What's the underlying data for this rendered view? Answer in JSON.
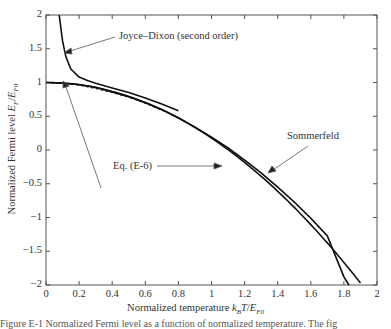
{
  "chart_data": {
    "type": "line",
    "title": "",
    "xlabel": "Normalized temperature k_B T/E_F0",
    "ylabel": "Normalized Fermi level E_F/E_F0",
    "xlim": [
      0,
      2
    ],
    "ylim": [
      -2,
      2
    ],
    "grid": false,
    "xticks": [
      "0",
      "0.2",
      "0.4",
      "0.6",
      "0.8",
      "1",
      "1.2",
      "1.4",
      "1.6",
      "1.8",
      "2"
    ],
    "yticks": [
      "2",
      "1.5",
      "1",
      "0.5",
      "0",
      "−0.5",
      "−1",
      "−1.5",
      "−2"
    ],
    "series": [
      {
        "name": "Joyce–Dixon (second order)",
        "style": "solid",
        "x": [
          0.08,
          0.1,
          0.12,
          0.15,
          0.2,
          0.25,
          0.3,
          0.4,
          0.5,
          0.6,
          0.7,
          0.8
        ],
        "y": [
          2.0,
          1.62,
          1.38,
          1.2,
          1.08,
          1.03,
          0.99,
          0.92,
          0.85,
          0.77,
          0.68,
          0.58
        ]
      },
      {
        "name": "Eq. (E-6)",
        "style": "solid",
        "x": [
          0,
          0.1,
          0.2,
          0.3,
          0.4,
          0.5,
          0.6,
          0.7,
          0.8,
          0.9,
          1.0,
          1.1,
          1.2,
          1.3,
          1.4,
          1.5,
          1.6,
          1.7,
          1.8,
          1.83
        ],
        "y": [
          1.0,
          0.99,
          0.97,
          0.93,
          0.86,
          0.79,
          0.7,
          0.6,
          0.48,
          0.34,
          0.19,
          0.03,
          -0.15,
          -0.34,
          -0.55,
          -0.77,
          -1.01,
          -1.27,
          -1.88,
          -2.0
        ]
      },
      {
        "name": "Dashed (exact)",
        "style": "dashed",
        "x": [
          0,
          0.1,
          0.2,
          0.3,
          0.4,
          0.5,
          0.6,
          0.7,
          0.8,
          0.9,
          1.0,
          1.1,
          1.2,
          1.3,
          1.4,
          1.5,
          1.6,
          1.7,
          1.8,
          1.83
        ],
        "y": [
          1.0,
          0.99,
          0.96,
          0.91,
          0.85,
          0.78,
          0.69,
          0.59,
          0.47,
          0.34,
          0.19,
          0.03,
          -0.15,
          -0.34,
          -0.55,
          -0.78,
          -1.02,
          -1.28,
          -1.88,
          -2.0
        ]
      },
      {
        "name": "Sommerfeld",
        "style": "solid",
        "formula": "1 - (pi^2/12) t^2",
        "x": [
          0,
          0.2,
          0.4,
          0.6,
          0.8,
          1.0,
          1.2,
          1.4,
          1.6,
          1.8,
          1.91
        ],
        "y": [
          1.0,
          0.967,
          0.868,
          0.704,
          0.474,
          0.178,
          -0.184,
          -0.612,
          -1.105,
          -1.664,
          -2.0
        ]
      }
    ],
    "annotations": [
      {
        "text": "Joyce–Dixon (second order)",
        "points_to": [
          0.12,
          1.38
        ]
      },
      {
        "text": "Eq. (E-6)",
        "points_to": [
          0.1,
          0.99
        ],
        "also_points_to": [
          1.05,
          0.1
        ]
      },
      {
        "text": "Sommerfeld",
        "points_to": [
          1.3,
          -0.2
        ]
      }
    ]
  },
  "labels": {
    "joyce": "Joyce–Dixon (second order)",
    "eq": "Eq. (E-6)",
    "sommerfeld": "Sommerfeld",
    "xlabel_main": "Normalized temperature ",
    "ylabel_main": "Normalized Fermi level ",
    "caption": "Figure E-1   Normalized Fermi level as a function of normalized temperature. The fig"
  }
}
